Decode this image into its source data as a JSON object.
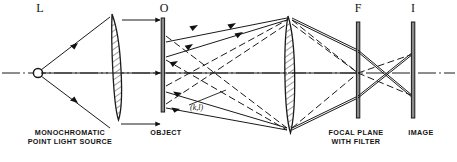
{
  "figure": {
    "background_color": "#ffffff",
    "line_color": "#1a1a1a"
  },
  "top_labels": [
    {
      "id": "source",
      "text": "L"
    },
    {
      "id": "object",
      "text": "O"
    },
    {
      "id": "focal-plane",
      "text": "F"
    },
    {
      "id": "image",
      "text": "I"
    }
  ],
  "bottom_captions": [
    {
      "id": "source",
      "text": "MONOCHROMATIC\nPOINT LIGHT SOURCE"
    },
    {
      "id": "object",
      "text": "OBJECT"
    },
    {
      "id": "focal-plane",
      "text": "FOCAL PLANE\nWITH FILTER"
    },
    {
      "id": "image",
      "text": "IMAGE"
    }
  ],
  "annotations": [
    {
      "id": "diffraction-order",
      "text": "(k,l)"
    }
  ],
  "components": [
    {
      "id": "point-source",
      "kind": "circle"
    },
    {
      "id": "collimating-lens",
      "kind": "biconvex-lens-hatched"
    },
    {
      "id": "object-plate",
      "kind": "vertical-plate"
    },
    {
      "id": "transform-lens",
      "kind": "biconvex-lens-hatched"
    },
    {
      "id": "focal-plane-plate",
      "kind": "vertical-plate"
    },
    {
      "id": "image-plate",
      "kind": "vertical-plate"
    }
  ]
}
